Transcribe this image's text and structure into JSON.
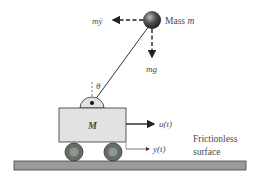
{
  "diagram": {
    "labels": {
      "inertial_force": "mÿ",
      "mass_label": "Mass m",
      "mass_label_prefix": "Mass ",
      "mass_label_var": "m",
      "gravity": "mg",
      "angle": "θ",
      "cart_mass": "M",
      "input_force": "u(t)",
      "position": "y(t)",
      "surface_line1": "Frictionless",
      "surface_line2": "surface"
    },
    "colors": {
      "cart_fill": "#e2e2e2",
      "ground_fill": "#9a9a9a",
      "wheel_outer": "#6a6a6a",
      "wheel_inner": "#8a9a8a",
      "ball": "#3a3a3a",
      "stroke": "#222222"
    }
  }
}
